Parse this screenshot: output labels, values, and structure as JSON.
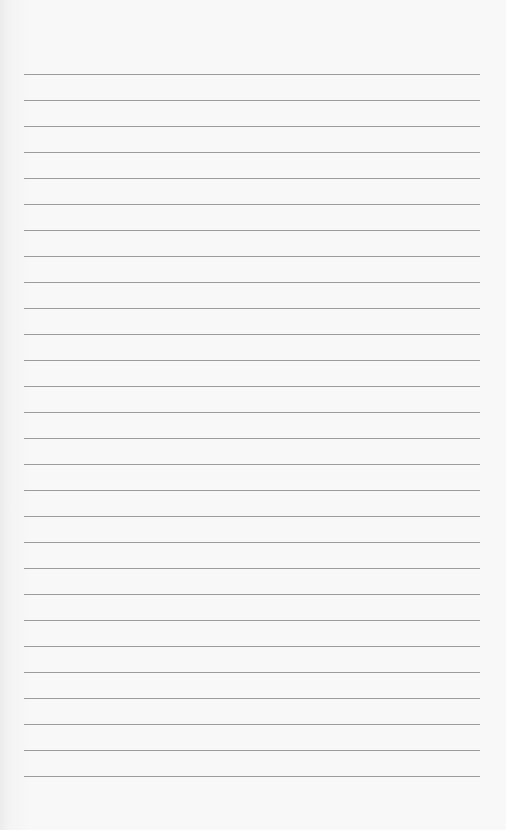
{
  "paper": {
    "type": "lined-paper",
    "background_color": "#f8f8f8",
    "line_color": "#9c9c9c",
    "line_count": 28,
    "first_line_y": 74,
    "line_spacing": 26,
    "line_left": 24,
    "line_right": 480
  }
}
